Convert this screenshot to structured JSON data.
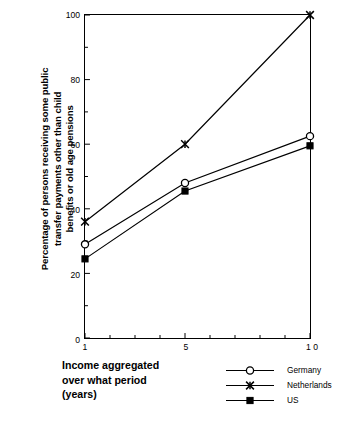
{
  "chart_data": {
    "type": "line",
    "title": "",
    "xlabel": "Income aggregated\nover what period\n(years)",
    "ylabel": "Percentage of persons receiving some public\ntransfer payments other than child\nbenefits or old age pensions",
    "x": [
      1,
      5,
      10
    ],
    "xlim": [
      1,
      10
    ],
    "ylim": [
      0,
      100
    ],
    "grid": false,
    "legend_position": "bottom-right",
    "x_ticks_major": [
      1,
      5,
      10
    ],
    "x_tick_labels": [
      "1",
      "5",
      "1 0"
    ],
    "x_ticks_minor": [
      2,
      3,
      4,
      6,
      7,
      8,
      9
    ],
    "y_ticks_major": [
      0,
      20,
      40,
      60,
      80,
      100
    ],
    "y_tick_labels": [
      "0",
      "20",
      "40",
      "60",
      "80",
      "100"
    ],
    "y_ticks_minor": [
      10,
      30,
      50,
      70,
      90
    ],
    "series": [
      {
        "name": "Germany",
        "marker": "open-circle",
        "color": "#000000",
        "values": [
          29,
          48,
          62.5
        ]
      },
      {
        "name": "Netherlands",
        "marker": "star-x",
        "color": "#000000",
        "values": [
          36,
          60,
          100
        ]
      },
      {
        "name": "US",
        "marker": "filled-square",
        "color": "#000000",
        "values": [
          24.5,
          45.5,
          59.5
        ]
      }
    ]
  },
  "legend": {
    "items": [
      {
        "label": "Germany",
        "marker": "open-circle"
      },
      {
        "label": "Netherlands",
        "marker": "star-x"
      },
      {
        "label": "US",
        "marker": "filled-square"
      }
    ]
  },
  "axes": {
    "y_title": "Percentage of persons receiving some public\ntransfer payments other than child\nbenefits or old age pensions",
    "x_title": "Income aggregated\nover what period\n(years)"
  }
}
